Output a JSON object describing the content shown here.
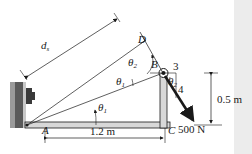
{
  "diagram": {
    "points": {
      "A": "A",
      "B": "B",
      "C": "C",
      "D": "D"
    },
    "angles": {
      "theta1": "θ",
      "theta1_sub": "1",
      "theta2": "θ",
      "theta2_sub": "2"
    },
    "distance_label": "d",
    "distance_sub": "s",
    "dimensions": {
      "horizontal": "1.2 m",
      "vertical": "0.5 m"
    },
    "force": {
      "magnitude": "500 N",
      "slope_horizontal": "3",
      "slope_vertical": "4"
    },
    "colors": {
      "line": "#1a1a1a",
      "member_fill": "#d8d8d8",
      "wall": "#6a6a6a",
      "strip": "#ececec"
    }
  }
}
